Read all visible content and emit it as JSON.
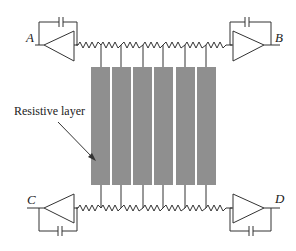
{
  "diagram": {
    "type": "circuit-schematic",
    "annotation": "Resistive layer",
    "nodes": [
      {
        "id": "A",
        "label": "A",
        "position": "top-left"
      },
      {
        "id": "B",
        "label": "B",
        "position": "top-right"
      },
      {
        "id": "C",
        "label": "C",
        "position": "bottom-left"
      },
      {
        "id": "D",
        "label": "D",
        "position": "bottom-right"
      }
    ],
    "amplifiers": [
      {
        "id": "amp-A",
        "node": "A",
        "direction": "left",
        "feedback": "capacitor"
      },
      {
        "id": "amp-B",
        "node": "B",
        "direction": "right",
        "feedback": "capacitor"
      },
      {
        "id": "amp-C",
        "node": "C",
        "direction": "left",
        "feedback": "capacitor"
      },
      {
        "id": "amp-D",
        "node": "D",
        "direction": "right",
        "feedback": "capacitor"
      }
    ],
    "resistor_chains": [
      {
        "id": "top-chain",
        "from": "A",
        "to": "B",
        "resistors": 7
      },
      {
        "id": "bottom-chain",
        "from": "C",
        "to": "D",
        "resistors": 7
      }
    ],
    "strips": {
      "count": 6,
      "color": "#8f8f8f"
    },
    "colors": {
      "line": "#333333",
      "strip": "#8f8f8f",
      "background": "#ffffff"
    }
  }
}
